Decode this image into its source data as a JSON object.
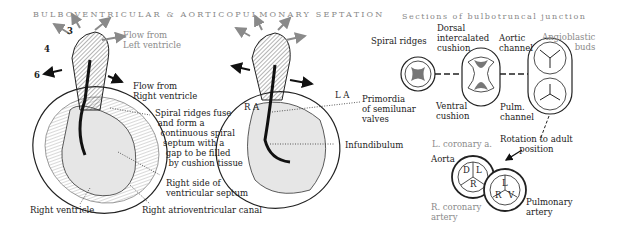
{
  "header": {
    "title_main": "BULBOVENTRICULAR & AORTICOPULMONARY SEPTATION",
    "title_sections": "Sections of bulbotruncal junction"
  },
  "arch_numbers": [
    "3",
    "4",
    "6"
  ],
  "left_heart": {
    "flow_left": "Flow from\nLeft ventricle",
    "flow_right": "Flow from\nRight ventricle",
    "spiral_note": "Spiral ridges fuse\n and form a\n  continuous spiral\n   septum with a\n    gap to be filled\n     by cushion tissue",
    "right_septum": "Right side of\nventricular septum",
    "right_ventricle": "Right ventricle",
    "right_av_canal": "Right atrioventricular canal"
  },
  "middle_heart": {
    "ra": "R A",
    "la": "L A",
    "primordia": "Primordia\nof semilunar\nvalves",
    "infundibulum": "Infundibulum"
  },
  "sections": {
    "spiral_ridges": "Spiral ridges",
    "dorsal_cushion": "Dorsal\nintercalated\ncushion",
    "aortic_channel": "Aortic\nchannel",
    "angioblastic_buds": "Angioblastic\nbuds",
    "ventral_cushion": "Ventral\ncushion",
    "pulm_channel": "Pulm.\nchannel",
    "rotation": "Rotation to adult\nposition",
    "l_coronary": "L. coronary a.",
    "aorta": "Aorta",
    "r_coronary": "R. coronary\nartery",
    "pulmonary_artery": "Pulmonary\nartery",
    "aortic_cusps": [
      "D",
      "L",
      "R"
    ],
    "pulmonary_cusps": [
      "L",
      "R",
      "V"
    ]
  },
  "colors": {
    "ink": "#222222",
    "arrow_gray": "#8a8a8a",
    "fill_gray": "#777777",
    "light_fill": "#e6e6e6"
  }
}
